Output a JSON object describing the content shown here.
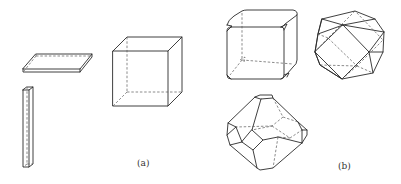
{
  "figure": {
    "panels": [
      {
        "id": "a",
        "label": "(a)",
        "shapes": [
          "flat-plate",
          "needle-prism",
          "cube"
        ]
      },
      {
        "id": "b",
        "label": "(b)",
        "shapes": [
          "truncated-cube",
          "cuboctahedron",
          "truncated-octahedron"
        ]
      }
    ]
  }
}
